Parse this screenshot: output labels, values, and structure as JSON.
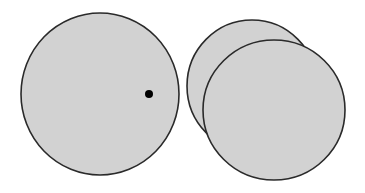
{
  "diagram": {
    "colors": {
      "fill": "#d2d2d2",
      "stroke": "#2a2a2a",
      "dot": "#000000",
      "background": "#ffffff"
    },
    "shapes": {
      "single_disc": {
        "cx": 100,
        "cy": 94,
        "rx": 79,
        "ry": 81
      },
      "dot": {
        "cx": 149,
        "cy": 94,
        "r": 4
      },
      "back_disc": {
        "cx": 252,
        "cy": 86,
        "rx": 65,
        "ry": 66
      },
      "front_disc": {
        "cx": 274,
        "cy": 110,
        "rx": 71,
        "ry": 70
      }
    }
  }
}
